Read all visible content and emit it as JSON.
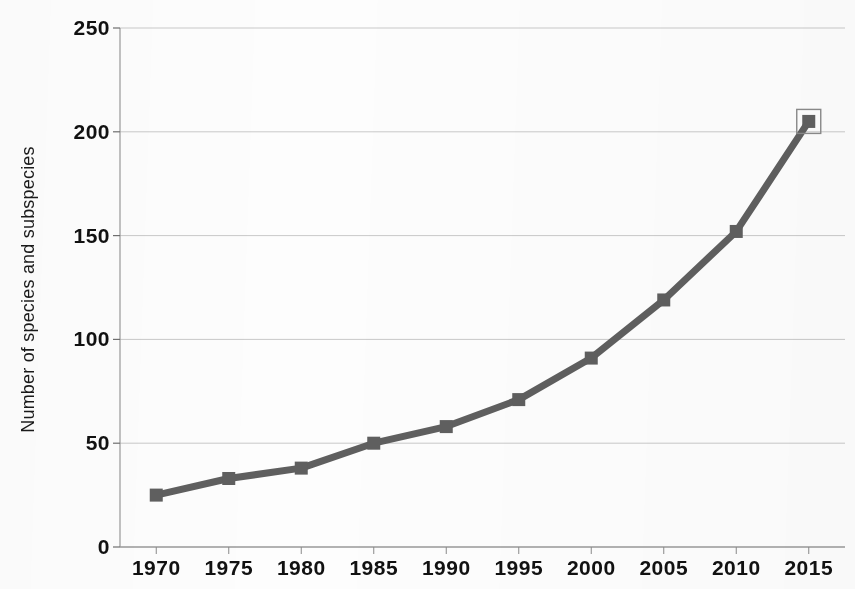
{
  "chart_data": {
    "type": "line",
    "title": "",
    "xlabel": "",
    "ylabel": "Number of species and subspecies",
    "x": [
      1970,
      1975,
      1980,
      1985,
      1990,
      1995,
      2000,
      2005,
      2010,
      2015
    ],
    "values": [
      25,
      33,
      38,
      50,
      58,
      71,
      91,
      119,
      152,
      205
    ],
    "xtick_labels": [
      "1970",
      "1975",
      "1980",
      "1985",
      "1990",
      "1995",
      "2000",
      "2005",
      "2010",
      "2015"
    ],
    "ytick_labels": [
      "0",
      "50",
      "100",
      "150",
      "200",
      "250"
    ],
    "yticks": [
      0,
      50,
      100,
      150,
      200,
      250
    ],
    "ylim": [
      0,
      250
    ],
    "xlim": [
      1967.5,
      2017.5
    ],
    "grid": "horizontal",
    "legend": "none",
    "series_color": "#5f5f5f",
    "grid_color": "#c9c9c9",
    "marker": "square",
    "selected_point_index": 9,
    "selection_box_color": "#8a8a8a"
  },
  "plot_geometry": {
    "left": 120,
    "right": 845,
    "top": 28,
    "bottom": 547
  }
}
